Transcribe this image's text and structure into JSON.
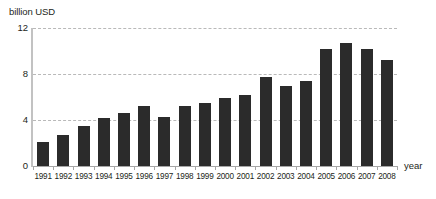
{
  "chart_data": {
    "type": "bar",
    "title": "",
    "subtitle": "",
    "xlabel": "year",
    "ylabel": "billion USD",
    "categories": [
      "1991",
      "1992",
      "1993",
      "1994",
      "1995",
      "1996",
      "1997",
      "1998",
      "1999",
      "2000",
      "2001",
      "2002",
      "2003",
      "2004",
      "2005",
      "2006",
      "2007",
      "2008"
    ],
    "values": [
      2.1,
      2.7,
      3.5,
      4.2,
      4.6,
      5.2,
      4.3,
      5.2,
      5.5,
      5.9,
      6.2,
      7.7,
      7.0,
      7.4,
      10.2,
      10.7,
      10.2,
      9.2
    ],
    "ylim": [
      0,
      12
    ],
    "yticks": [
      0,
      4,
      8,
      12
    ],
    "ytick_labels": [
      "0",
      "4",
      "8",
      "12"
    ],
    "grid": true,
    "legend": false,
    "legend_position": "none",
    "bar_color": "#2b2b2b",
    "gridline_color": "#b9b9b9",
    "axis_color": "#c2c2c2",
    "text_color": "#231f20",
    "background": "#ffffff"
  }
}
